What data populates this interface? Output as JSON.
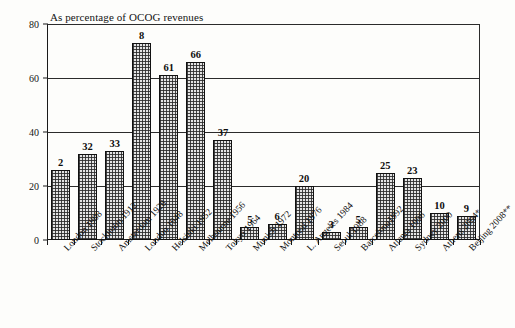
{
  "chart_data": {
    "type": "bar",
    "title": "As percentage of OCOG revenues",
    "xlabel": "",
    "ylabel": "",
    "ylim": [
      0,
      80
    ],
    "yticks": [
      0,
      20,
      40,
      60,
      80
    ],
    "grid": true,
    "legend": null,
    "categories": [
      "London 1908",
      "Stockholm 1912",
      "Amsterdam 1928",
      "London 1948",
      "Helsinki 1952",
      "Melbourne 1956",
      "Tokyo 1964",
      "Munich 1972",
      "Montreal 1976",
      "L. Angeles 1984",
      "Seoul 1988",
      "Barcelona1992",
      "Atlanta 1996",
      "Sydney 2000",
      "Athens 2004*",
      "Beijing 2008**"
    ],
    "values": [
      26,
      32,
      33,
      73,
      61,
      66,
      37,
      5,
      6,
      20,
      3,
      5,
      25,
      23,
      10,
      9
    ],
    "data_labels": [
      "2",
      "32",
      "33",
      "8",
      "61",
      "66",
      "37",
      "5",
      "6",
      "20",
      "3",
      "5",
      "25",
      "23",
      "10",
      "9"
    ]
  },
  "style": {
    "bar_fill": "#e4e4e4",
    "bar_edge": "#111111",
    "axis_color": "#1a1a1a",
    "text_color": "#0f0f0f",
    "background": "#fdfdfb"
  }
}
